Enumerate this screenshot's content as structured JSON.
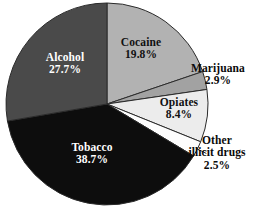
{
  "chart_data": {
    "type": "pie",
    "title": "",
    "subtitle": "",
    "xlabel": "",
    "ylabel": "",
    "legend_position": "none",
    "grid": false,
    "start_angle_deg": 0,
    "direction": "clockwise",
    "units": "percent",
    "categories": [
      "Cocaine",
      "Marijuana",
      "Opiates",
      "Other illicit drugs",
      "Tobacco",
      "Alcohol"
    ],
    "values": [
      19.8,
      2.9,
      8.4,
      2.5,
      38.7,
      27.7
    ],
    "value_labels": [
      "19.8%",
      "2.9%",
      "8.4%",
      "2.5%",
      "38.7%",
      "27.7%"
    ],
    "colors": [
      "#b2b2b2",
      "#a2a2a2",
      "#ececec",
      "#fdfdfd",
      "#0d0d0d",
      "#4a4a4a"
    ],
    "slices": [
      {
        "name": "Cocaine",
        "name_line2": "",
        "value": 19.8,
        "value_label": "19.8%",
        "color": "#b2b2b2",
        "label_placement": "inside",
        "text_color": "#111111"
      },
      {
        "name": "Marijuana",
        "name_line2": "",
        "value": 2.9,
        "value_label": "2.9%",
        "color": "#a2a2a2",
        "label_placement": "outside",
        "text_color": "#0a0a0a"
      },
      {
        "name": "Opiates",
        "name_line2": "",
        "value": 8.4,
        "value_label": "8.4%",
        "color": "#ececec",
        "label_placement": "inside",
        "text_color": "#111111"
      },
      {
        "name": "Other",
        "name_line2": "illicit drugs",
        "value": 2.5,
        "value_label": "2.5%",
        "color": "#fdfdfd",
        "label_placement": "outside",
        "text_color": "#0a0a0a"
      },
      {
        "name": "Tobacco",
        "name_line2": "",
        "value": 38.7,
        "value_label": "38.7%",
        "color": "#0d0d0d",
        "label_placement": "inside",
        "text_color": "#ffffff"
      },
      {
        "name": "Alcohol",
        "name_line2": "",
        "value": 27.7,
        "value_label": "27.7%",
        "color": "#4a4a4a",
        "label_placement": "inside",
        "text_color": "#ffffff"
      }
    ],
    "geometry": {
      "center_x": 107,
      "center_y": 104,
      "radius": 101,
      "stroke_color": "#2b2b2b",
      "stroke_width": 1
    }
  }
}
